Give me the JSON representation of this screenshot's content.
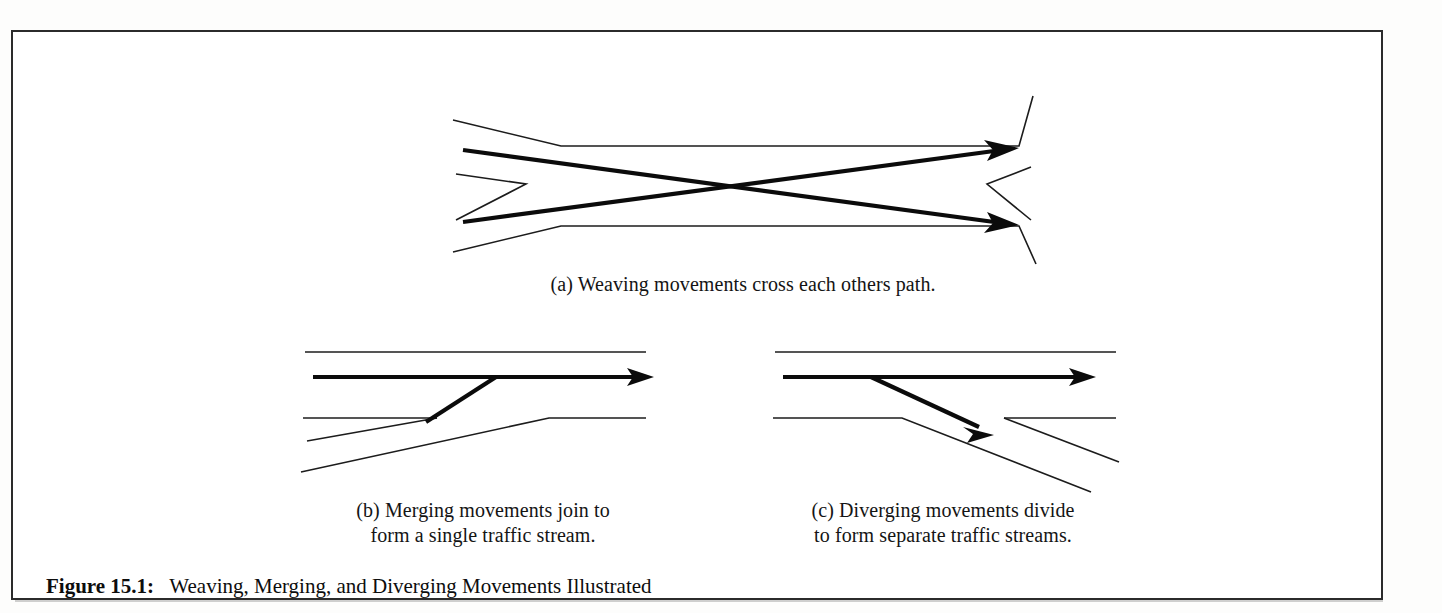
{
  "figure": {
    "label": "Figure 15.1:",
    "title": "Weaving, Merging, and Diverging Movements Illustrated",
    "frame_color": "#2b2b2b",
    "background": "#ffffff",
    "line_color": "#1c1c1c",
    "arrow_color": "#0b0b0b"
  },
  "panels": [
    {
      "key": "a",
      "name": "weaving",
      "caption": "(a) Weaving movements cross each others path.",
      "arrows": 2,
      "description": "Two bold arrows cross each other between opposing entry and exit ramps"
    },
    {
      "key": "b",
      "name": "merging",
      "caption": "(b) Merging movements join to\nform a single traffic stream.",
      "arrows": 2,
      "description": "A ramp arrow angles upward to join a through-lane arrow"
    },
    {
      "key": "c",
      "name": "diverging",
      "caption": "(c) Diverging movements divide\nto form separate traffic streams.",
      "arrows": 2,
      "description": "A through-lane arrow splits with a second arrow angling downward onto an exit ramp"
    }
  ]
}
